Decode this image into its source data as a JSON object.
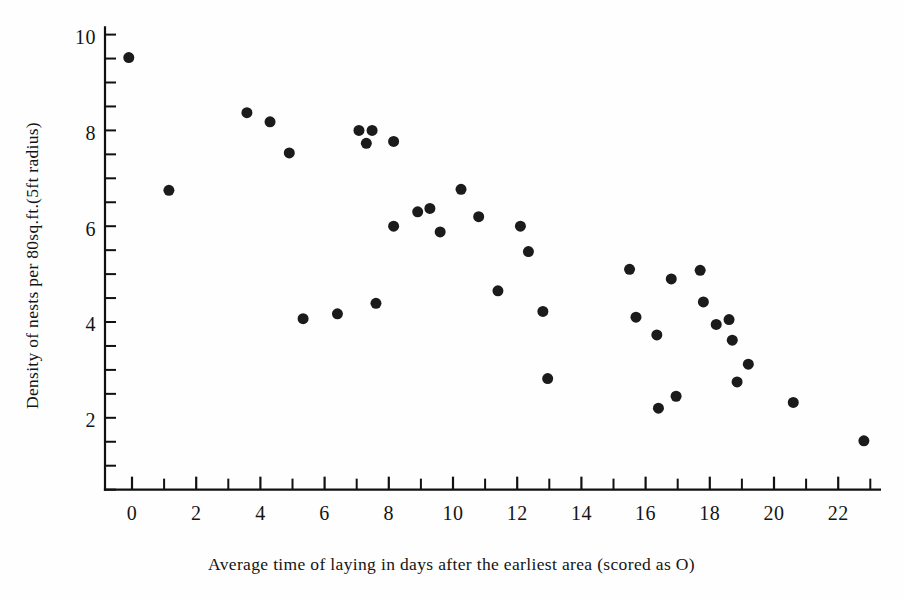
{
  "chart_data": {
    "type": "scatter",
    "title": "",
    "xlabel": "Average time of laying in days after the earliest area (scored as O)",
    "ylabel": "Density of nests per 80sq.ft.(5ft radius)",
    "xlim": [
      -1.0,
      23.3
    ],
    "ylim": [
      0.55,
      10.2
    ],
    "xticks": [
      0,
      2,
      4,
      6,
      8,
      10,
      12,
      14,
      16,
      18,
      20,
      22
    ],
    "xtick_labels": [
      "0",
      "2",
      "4",
      "6",
      "8",
      "10",
      "12",
      "14",
      "16",
      "18",
      "20",
      "22"
    ],
    "xminor_step": 1,
    "yticks": [
      2,
      4,
      6,
      8,
      10
    ],
    "ytick_labels": [
      "2",
      "4",
      "6",
      "8",
      "10"
    ],
    "yminor_step": 0.5,
    "grid": false,
    "legend": null,
    "marker": "filled-circle",
    "marker_color": "#1b1b1b",
    "marker_size_px": 11,
    "points": [
      {
        "x": -0.1,
        "y": 9.57
      },
      {
        "x": 1.15,
        "y": 6.8
      },
      {
        "x": 3.58,
        "y": 8.42
      },
      {
        "x": 4.3,
        "y": 8.23
      },
      {
        "x": 4.9,
        "y": 7.58
      },
      {
        "x": 5.33,
        "y": 4.12
      },
      {
        "x": 6.4,
        "y": 4.22
      },
      {
        "x": 7.07,
        "y": 8.05
      },
      {
        "x": 7.48,
        "y": 8.05
      },
      {
        "x": 7.3,
        "y": 7.78
      },
      {
        "x": 7.6,
        "y": 4.44
      },
      {
        "x": 8.15,
        "y": 7.82
      },
      {
        "x": 8.15,
        "y": 6.05
      },
      {
        "x": 8.9,
        "y": 6.35
      },
      {
        "x": 9.28,
        "y": 6.42
      },
      {
        "x": 9.6,
        "y": 5.93
      },
      {
        "x": 10.25,
        "y": 6.82
      },
      {
        "x": 10.8,
        "y": 6.25
      },
      {
        "x": 11.4,
        "y": 4.7
      },
      {
        "x": 12.1,
        "y": 6.05
      },
      {
        "x": 12.35,
        "y": 5.52
      },
      {
        "x": 12.8,
        "y": 4.27
      },
      {
        "x": 12.95,
        "y": 2.87
      },
      {
        "x": 15.5,
        "y": 5.15
      },
      {
        "x": 15.7,
        "y": 4.15
      },
      {
        "x": 16.35,
        "y": 3.78
      },
      {
        "x": 16.4,
        "y": 2.25
      },
      {
        "x": 16.8,
        "y": 4.95
      },
      {
        "x": 16.95,
        "y": 2.5
      },
      {
        "x": 17.7,
        "y": 5.13
      },
      {
        "x": 17.8,
        "y": 4.47
      },
      {
        "x": 18.2,
        "y": 4.0
      },
      {
        "x": 18.6,
        "y": 4.1
      },
      {
        "x": 18.7,
        "y": 3.67
      },
      {
        "x": 18.85,
        "y": 2.8
      },
      {
        "x": 19.2,
        "y": 3.17
      },
      {
        "x": 20.6,
        "y": 2.37
      },
      {
        "x": 22.8,
        "y": 1.57
      }
    ]
  },
  "axes": {
    "x_axis_label": "Average time of laying in days after the earliest area (scored as O)",
    "y_axis_label": "Density of nests per 80sq.ft.(5ft radius)"
  },
  "colors": {
    "marker": "#1b1b1b",
    "axis": "#111111",
    "background": "#fefefe",
    "text": "#141414"
  }
}
